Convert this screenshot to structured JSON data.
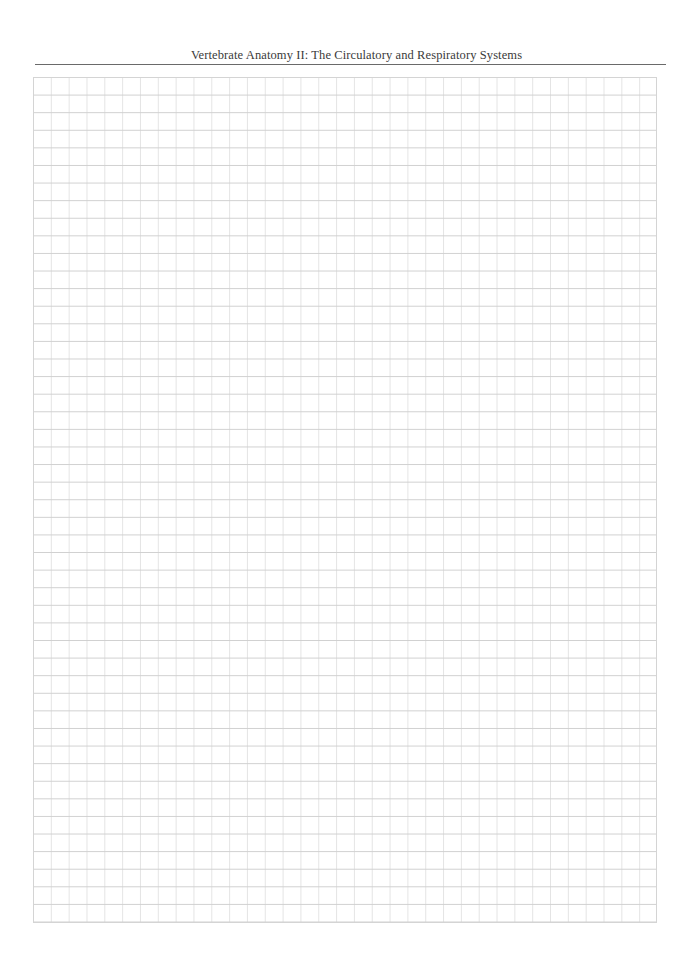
{
  "header": {
    "title": "Vertebrate Anatomy II: The Circulatory and Respiratory Systems"
  },
  "grid": {
    "description": "blank graph paper grid",
    "columns": 35,
    "rows": 48,
    "line_color": "#d0d0d0",
    "border_color": "#d4d4d4"
  }
}
